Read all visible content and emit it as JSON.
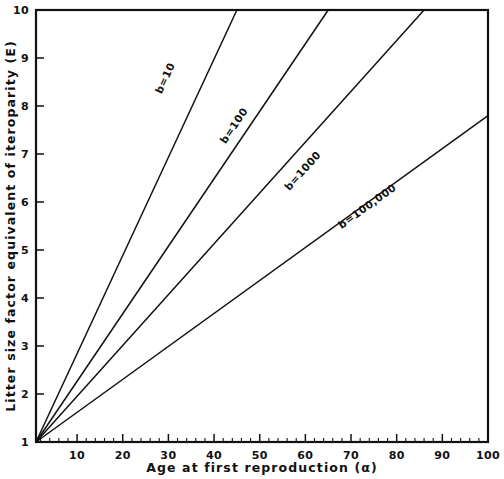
{
  "chart_data": {
    "type": "line",
    "title": "",
    "xlabel": "Age at first reproduction (α)",
    "ylabel": "Litter size factor equivalent of iteroparity (E)",
    "xlim": [
      1,
      100
    ],
    "ylim": [
      1,
      10
    ],
    "grid": false,
    "legend_position": "inline-curve-labels",
    "xticks": [
      10,
      20,
      30,
      40,
      50,
      60,
      70,
      80,
      90,
      100
    ],
    "xtick_labels": [
      "10",
      "20",
      "30",
      "40",
      "50",
      "60",
      "70",
      "80",
      "90",
      "100"
    ],
    "xminor_tick_step": 2,
    "yticks": [
      1,
      2,
      3,
      4,
      5,
      6,
      7,
      8,
      9,
      10
    ],
    "ytick_labels": [
      "1",
      "2",
      "3",
      "4",
      "5",
      "6",
      "7",
      "8",
      "9",
      "10"
    ],
    "series": [
      {
        "name": "b=10",
        "label": "b=10",
        "label_x": 30,
        "label_y": 8.55,
        "x": [
          1,
          45
        ],
        "y": [
          1,
          10
        ],
        "slope_per_alpha": 0.2045
      },
      {
        "name": "b=100",
        "label": "b=100",
        "label_x": 45,
        "label_y": 7.55,
        "x": [
          1,
          65
        ],
        "y": [
          1,
          10
        ],
        "slope_per_alpha": 0.1406
      },
      {
        "name": "b=1000",
        "label": "b=1000",
        "label_x": 60,
        "label_y": 6.6,
        "x": [
          1,
          86
        ],
        "y": [
          1,
          10
        ],
        "slope_per_alpha": 0.1059
      },
      {
        "name": "b=100,000",
        "label": "b=100,000",
        "label_x": 74,
        "label_y": 5.85,
        "x": [
          1,
          100
        ],
        "y": [
          1,
          7.8
        ],
        "slope_per_alpha": 0.0687
      }
    ]
  },
  "figure": {
    "background_color": "#ffffff",
    "line_color": "#111111",
    "frame_color": "#111111"
  }
}
